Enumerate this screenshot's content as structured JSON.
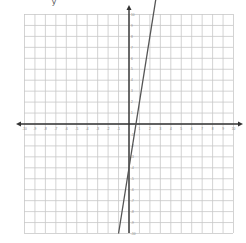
{
  "page": {
    "corner_glyph": "y"
  },
  "chart_data": {
    "type": "line",
    "title": "",
    "xlabel": "",
    "ylabel": "",
    "xlim": [
      -10,
      10
    ],
    "ylim": [
      -10,
      10
    ],
    "grid": true,
    "x_ticks": [
      -10,
      -9,
      -8,
      -7,
      -6,
      -5,
      -4,
      -3,
      -2,
      -1,
      1,
      2,
      3,
      4,
      5,
      6,
      7,
      8,
      9,
      10
    ],
    "y_ticks": [
      -10,
      -9,
      -8,
      -7,
      -6,
      -5,
      -4,
      -3,
      -2,
      -1,
      1,
      2,
      3,
      4,
      5,
      6,
      7,
      8,
      9,
      10
    ],
    "series": [
      {
        "name": "line",
        "equation": "y = 6x - 4",
        "slope": 6,
        "intercept": -4,
        "x": [
          -1,
          2.6
        ],
        "y": [
          -10,
          11.6
        ],
        "color": "#555555"
      }
    ],
    "axis_arrows": true,
    "colors": {
      "grid": "#c8c8c8",
      "axis": "#333333",
      "line": "#555555",
      "tick_label": "#888888"
    }
  }
}
